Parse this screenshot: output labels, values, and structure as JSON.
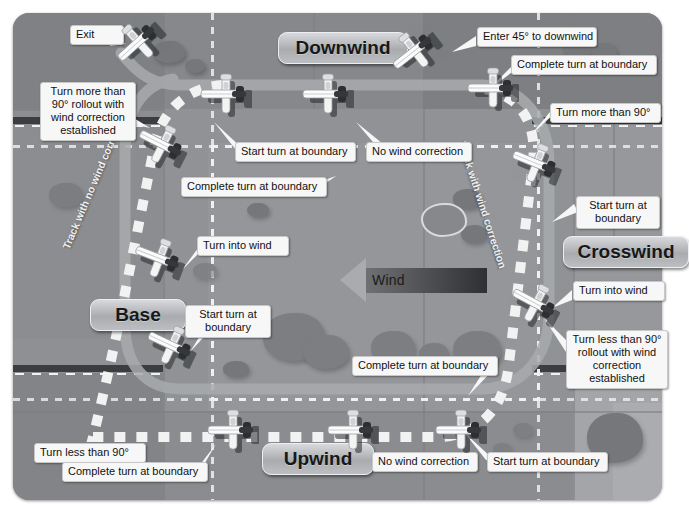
{
  "diagram": {
    "wind": {
      "label": "Wind",
      "direction": "left"
    }
  },
  "legs": [
    {
      "id": "downwind",
      "label": "Downwind",
      "x": 278,
      "y": 32,
      "w": 104,
      "h": 30
    },
    {
      "id": "crosswind",
      "label": "Crosswind",
      "x": 563,
      "y": 236,
      "w": 100,
      "h": 30
    },
    {
      "id": "base",
      "label": "Base",
      "x": 90,
      "y": 299,
      "w": 70,
      "h": 30
    },
    {
      "id": "upwind",
      "label": "Upwind",
      "x": 262,
      "y": 443,
      "w": 86,
      "h": 30
    }
  ],
  "track_annotations": [
    {
      "id": "no-wind-correction-left",
      "text": "Track with no wind correction",
      "x": 60,
      "y": 246,
      "rotate": -67
    },
    {
      "id": "wind-correction-right",
      "text": "Track with wind correction",
      "x": 468,
      "y": 140,
      "rotate": 72
    }
  ],
  "callouts": [
    {
      "id": "exit",
      "text": "Exit",
      "x": 70,
      "y": 25,
      "w": 42,
      "multi": false
    },
    {
      "id": "turn-more-90-rollout",
      "text": "Turn more than 90° rollout with wind correction established",
      "x": 40,
      "y": 82,
      "w": 84,
      "multi": true
    },
    {
      "id": "start-turn-boundary-dw",
      "text": "Start turn at boundary",
      "x": 235,
      "y": 142,
      "w": 109,
      "multi": false
    },
    {
      "id": "no-wind-correction-dw",
      "text": "No wind correction",
      "x": 366,
      "y": 142,
      "w": 94,
      "multi": false
    },
    {
      "id": "complete-turn-boundary-nw",
      "text": "Complete turn at boundary",
      "x": 181,
      "y": 177,
      "w": 134,
      "multi": false
    },
    {
      "id": "turn-into-wind-base",
      "text": "Turn into wind",
      "x": 197,
      "y": 236,
      "w": 80,
      "multi": false
    },
    {
      "id": "start-turn-boundary-base",
      "text": "Start turn at boundary",
      "x": 185,
      "y": 305,
      "w": 74,
      "multi": true
    },
    {
      "id": "turn-less-90",
      "text": "Turn less than 90°",
      "x": 34,
      "y": 443,
      "w": 100,
      "multi": false
    },
    {
      "id": "complete-turn-boundary-up",
      "text": "Complete turn at boundary",
      "x": 62,
      "y": 462,
      "w": 134,
      "multi": false
    },
    {
      "id": "no-wind-correction-up",
      "text": "No wind correction",
      "x": 372,
      "y": 452,
      "w": 94,
      "multi": false
    },
    {
      "id": "start-turn-boundary-up",
      "text": "Start turn at boundary",
      "x": 487,
      "y": 452,
      "w": 109,
      "multi": false
    },
    {
      "id": "complete-turn-boundary-se",
      "text": "Complete turn at boundary",
      "x": 352,
      "y": 356,
      "w": 134,
      "multi": false
    },
    {
      "id": "turn-less-90-rollout",
      "text": "Turn less than 90° rollout with wind correction established",
      "x": 566,
      "y": 330,
      "w": 90,
      "multi": true
    },
    {
      "id": "turn-into-wind-cw",
      "text": "Turn into wind",
      "x": 573,
      "y": 281,
      "w": 80,
      "multi": false
    },
    {
      "id": "start-turn-boundary-cw",
      "text": "Start turn at boundary",
      "x": 576,
      "y": 196,
      "w": 72,
      "multi": true
    },
    {
      "id": "turn-more-90-cw",
      "text": "Turn more than 90°",
      "x": 550,
      "y": 103,
      "w": 99,
      "multi": false
    },
    {
      "id": "complete-turn-boundary-ne",
      "text": "Complete turn at boundary",
      "x": 511,
      "y": 55,
      "w": 134,
      "multi": false
    },
    {
      "id": "enter-45-downwind",
      "text": "Enter 45° to downwind",
      "x": 477,
      "y": 27,
      "w": 108,
      "multi": false
    }
  ],
  "aircraft": [
    {
      "id": "ac-exit",
      "x": 112,
      "y": 21,
      "rotate": -42
    },
    {
      "id": "ac-downwind-1",
      "x": 198,
      "y": 73,
      "rotate": 0
    },
    {
      "id": "ac-downwind-2",
      "x": 300,
      "y": 73,
      "rotate": 0
    },
    {
      "id": "ac-downwind-entry",
      "x": 388,
      "y": 30,
      "rotate": -38
    },
    {
      "id": "ac-downwind-3",
      "x": 465,
      "y": 67,
      "rotate": 0
    },
    {
      "id": "ac-crosswind-start",
      "x": 508,
      "y": 142,
      "rotate": 22
    },
    {
      "id": "ac-crosswind-wind",
      "x": 507,
      "y": 282,
      "rotate": 28
    },
    {
      "id": "ac-nw-complete",
      "x": 134,
      "y": 123,
      "rotate": 27
    },
    {
      "id": "ac-base-turn",
      "x": 131,
      "y": 237,
      "rotate": 21
    },
    {
      "id": "ac-base-start",
      "x": 143,
      "y": 324,
      "rotate": 25
    },
    {
      "id": "ac-upwind-1",
      "x": 205,
      "y": 409,
      "rotate": 0
    },
    {
      "id": "ac-upwind-2",
      "x": 325,
      "y": 409,
      "rotate": 0
    },
    {
      "id": "ac-upwind-3",
      "x": 433,
      "y": 409,
      "rotate": 0
    }
  ],
  "colors": {
    "terrain": "#8e9093",
    "callout_bg": "#f7f7f7",
    "leg_plaque": "#a9abae",
    "track_solid": "#a8aaad",
    "track_dotted": "#f2f2f2",
    "wind_bar_dark": "#2e3033"
  }
}
